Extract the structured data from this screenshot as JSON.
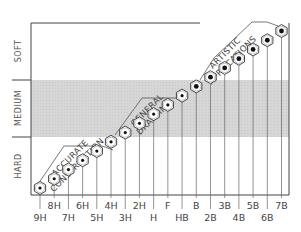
{
  "chart_data": {
    "type": "scatter",
    "title": "",
    "xlabel": "Pencil grade",
    "ylabel": "Hardness",
    "categories": [
      "9H",
      "8H",
      "7H",
      "6H",
      "5H",
      "4H",
      "3H",
      "2H",
      "H",
      "F",
      "HB",
      "B",
      "2B",
      "3B",
      "4B",
      "5B",
      "6B",
      "7B"
    ],
    "values": [
      1,
      2,
      3,
      4,
      5,
      6,
      7,
      8,
      9,
      10,
      11,
      12,
      13,
      14,
      15,
      16,
      17,
      18
    ],
    "y_bands": [
      {
        "label": "HARD",
        "shaded": false
      },
      {
        "label": "MEDIUM",
        "shaded": true
      },
      {
        "label": "SOFT",
        "shaded": false
      }
    ],
    "annotations": [
      {
        "label_lines": [
          "ACCURATE",
          "CONSTRUCTION"
        ],
        "from": "9H",
        "to": "3H"
      },
      {
        "label_lines": [
          "GENERAL",
          "DRAFTING"
        ],
        "from": "4H",
        "to": "B"
      },
      {
        "label_lines": [
          "ARTISTIC",
          "APPLICATIONS"
        ],
        "from": "2B",
        "to": "7B"
      }
    ],
    "grid": false,
    "legend": "none",
    "marker": "hexagon"
  },
  "colors": {
    "frame": "#444444",
    "medium_band": "#d4d4d4",
    "marker_fill": "#ffffff",
    "marker_dot": "#111111",
    "text": "#444444"
  }
}
